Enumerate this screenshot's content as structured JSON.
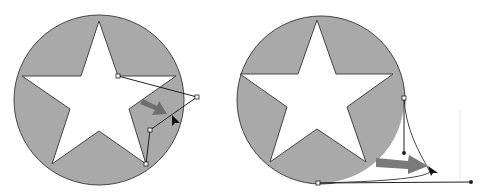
{
  "figure": {
    "panels": [
      {
        "id": "left",
        "description": "Star inside gray circle; an anchor point dragged outward creating straight segments"
      },
      {
        "id": "right",
        "description": "Star inside gray circle; a segment dragged to form a curve with direction handles"
      }
    ]
  },
  "colors": {
    "background": "#ffffff",
    "circle_fill": "#a9a9a9",
    "outline": "#444444",
    "star_fill": "#ffffff",
    "arrow": "#6e6e6e",
    "cursor": "#111111"
  }
}
